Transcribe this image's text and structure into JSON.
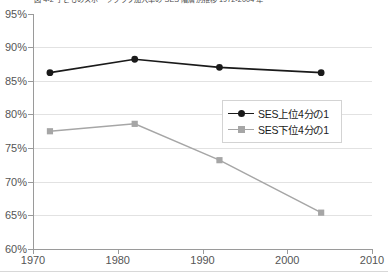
{
  "chart_data": {
    "type": "line",
    "title": "図 4-2  子どものスポーツクラブ加入率の SES 階層別推移 1972-2004 年",
    "xlabel": "",
    "ylabel": "",
    "x": [
      1972,
      1982,
      1992,
      2004
    ],
    "xlim": [
      1970,
      2010
    ],
    "ylim": [
      60,
      95
    ],
    "ytick_labels": [
      "95%",
      "90%",
      "85%",
      "80%",
      "75%",
      "70%",
      "65%",
      "60%"
    ],
    "ytick_values": [
      95,
      90,
      85,
      80,
      75,
      70,
      65,
      60
    ],
    "xtick_labels": [
      "1970",
      "1980",
      "1990",
      "2000",
      "2010"
    ],
    "xtick_values": [
      1970,
      1980,
      1990,
      2000,
      2010
    ],
    "grid": true,
    "legend_position": "center-right",
    "series": [
      {
        "name": "SES上位4分の1",
        "color": "#1a1a1a",
        "marker": "circle",
        "values": [
          86.2,
          88.2,
          87.0,
          86.2
        ]
      },
      {
        "name": "SES下位4分の1",
        "color": "#a6a6a6",
        "marker": "square",
        "values": [
          77.5,
          78.6,
          73.2,
          65.4
        ]
      }
    ]
  },
  "legend": {
    "items": [
      {
        "label": "SES上位4分の1"
      },
      {
        "label": "SES下位4分の1"
      }
    ]
  }
}
